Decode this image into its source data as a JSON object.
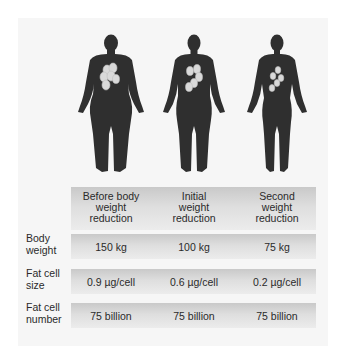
{
  "figures": [
    {
      "label": "before",
      "build": "heavy",
      "fat_cells": 6
    },
    {
      "label": "initial",
      "build": "medium",
      "fat_cells": 5
    },
    {
      "label": "second",
      "build": "slim",
      "fat_cells": 5
    }
  ],
  "table": {
    "columns": [
      "Before body weight reduction",
      "Initial weight reduction",
      "Second weight reduction"
    ],
    "column_lines": [
      [
        "Before body",
        "weight",
        "reduction"
      ],
      [
        "Initial",
        "weight",
        "reduction"
      ],
      [
        "Second",
        "weight",
        "reduction"
      ]
    ],
    "rows": [
      {
        "label": "Body weight",
        "label_lines": [
          "Body",
          "weight"
        ],
        "values": [
          "150 kg",
          "100 kg",
          "75 kg"
        ]
      },
      {
        "label": "Fat cell size",
        "label_lines": [
          "Fat cell",
          "size"
        ],
        "values": [
          "0.9 µg/cell",
          "0.6 µg/cell",
          "0.2 µg/cell"
        ]
      },
      {
        "label": "Fat cell number",
        "label_lines": [
          "Fat cell",
          "number"
        ],
        "values": [
          "75 billion",
          "75 billion",
          "75 billion"
        ]
      }
    ]
  },
  "colors": {
    "silhouette": "#2f2f2f",
    "fat_cell": "#d9d9d9",
    "panel": "#f6f6f6"
  }
}
